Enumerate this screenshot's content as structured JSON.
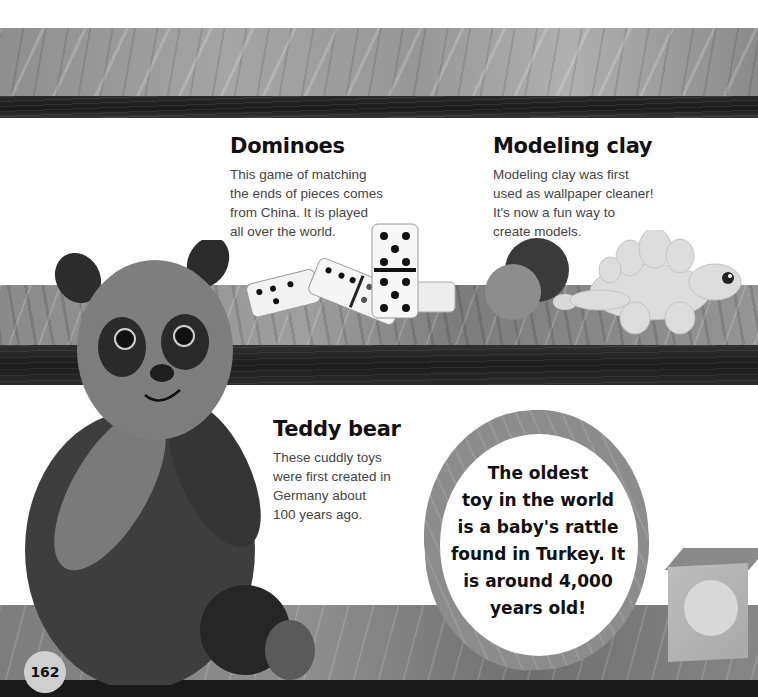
{
  "sections": {
    "dominoes": {
      "title": "Dominoes",
      "lines": [
        "This game of matching",
        "the ends of pieces comes",
        "from China. It is played",
        "all over the world."
      ]
    },
    "modeling_clay": {
      "title": "Modeling clay",
      "lines": [
        "Modeling clay was first",
        "used as wallpaper cleaner!",
        "It's now a fun way to",
        "create models."
      ]
    },
    "teddy_bear": {
      "title": "Teddy bear",
      "lines": [
        "These cuddly toys",
        "were first created in",
        "Germany about",
        "100 years ago."
      ]
    }
  },
  "fact_bubble": {
    "lines": [
      "The oldest",
      "toy in the world",
      "is a baby's rattle",
      "found in Turkey. It",
      "is around 4,000",
      "years old!"
    ]
  },
  "page_number": "162",
  "illustrations": {
    "top_shelf": "wood-shelf",
    "panda": "panda-teddy-bear",
    "dominoes": "dominoes-pieces",
    "clay": "clay-balls-and-stegosaurus",
    "block": "toy-block"
  }
}
